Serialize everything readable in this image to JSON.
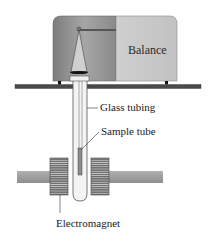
{
  "figure": {
    "labels": {
      "balance": "Balance",
      "glass_tubing": "Glass tubing",
      "sample_tube": "Sample tube",
      "electromagnet": "Electromagnet"
    },
    "colors": {
      "balance_dark": "#8f8f8f",
      "balance_light": "#c9c9c9",
      "shelf": "#4a4a4a",
      "rod": "#9a9a9a",
      "coil": "#5a5a5a",
      "tube": "#f2f2f2",
      "sample": "#8a8a8a",
      "line": "#333333"
    }
  }
}
